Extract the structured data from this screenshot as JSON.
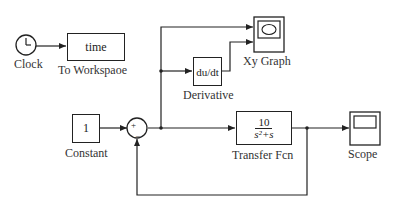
{
  "diagram": {
    "type": "simulink-block-diagram",
    "blocks": {
      "clock": {
        "label": "Clock"
      },
      "to_workspace": {
        "label": "To Workspaoe",
        "content": "time"
      },
      "derivative": {
        "label": "Derivative",
        "content_prefix": "du/dt"
      },
      "xy_graph": {
        "label": "Xy Graph"
      },
      "constant": {
        "label": "Constant",
        "content": "1"
      },
      "sum": {
        "signs": [
          "+",
          "-"
        ]
      },
      "transfer_fcn": {
        "label": "Transfer Fcn",
        "numerator": "10",
        "denominator": "s²+s"
      },
      "scope": {
        "label": "Scope"
      }
    },
    "connections": [
      {
        "from": "clock",
        "to": "to_workspace"
      },
      {
        "from": "constant",
        "to": "sum",
        "port": "+"
      },
      {
        "from": "sum",
        "to": "transfer_fcn"
      },
      {
        "from": "sum",
        "to": "xy_graph",
        "port": 1
      },
      {
        "from": "sum",
        "to": "derivative"
      },
      {
        "from": "derivative",
        "to": "xy_graph",
        "port": 2
      },
      {
        "from": "transfer_fcn",
        "to": "scope"
      },
      {
        "from": "transfer_fcn",
        "to": "sum",
        "port": "-"
      }
    ],
    "colors": {
      "line": "#222222",
      "background": "#ffffff"
    }
  }
}
